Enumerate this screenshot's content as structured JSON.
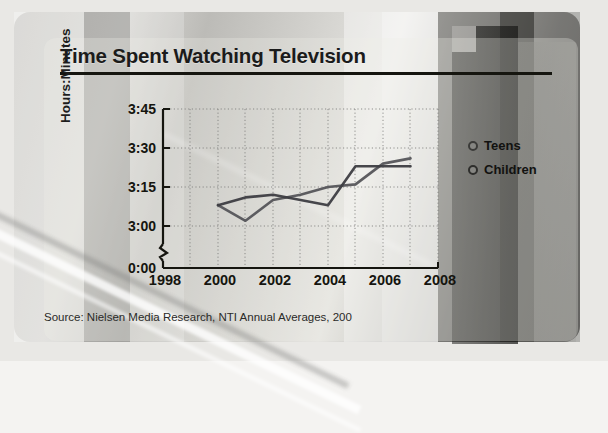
{
  "chart_data": {
    "type": "line",
    "title": "Time Spent Watching Television",
    "xlabel": "",
    "ylabel": "Hours:Minutes",
    "source": "Source: Nielsen Media Research, NTI Annual Averages, 200",
    "grid": true,
    "legend_position": "right",
    "axis_break": true,
    "x": [
      2000,
      2001,
      2002,
      2003,
      2004,
      2005,
      2006,
      2007
    ],
    "xlim": [
      1998,
      2008
    ],
    "xticks": [
      "1998",
      "2000",
      "2002",
      "2004",
      "2006",
      "2008"
    ],
    "xtick_values": [
      1998,
      2000,
      2002,
      2004,
      2006,
      2008
    ],
    "ylim_minutes": [
      180,
      225
    ],
    "yticks": [
      "0:00",
      "3:00",
      "3:15",
      "3:30",
      "3:45"
    ],
    "ytick_minutes": [
      0,
      180,
      195,
      210,
      225
    ],
    "series": [
      {
        "name": "Teens",
        "color": "#55555a",
        "values": [
          "3:08",
          "3:02",
          "3:10",
          "3:12",
          "3:15",
          "3:16",
          "3:24",
          "3:26"
        ],
        "values_minutes": [
          188,
          182,
          190,
          192,
          195,
          196,
          204,
          206
        ]
      },
      {
        "name": "Children",
        "color": "#3d3d42",
        "values": [
          "3:08",
          "3:11",
          "3:12",
          "3:10",
          "3:08",
          "3:23",
          "3:23",
          "3:23"
        ],
        "values_minutes": [
          188,
          191,
          192,
          190,
          188,
          203,
          203,
          203
        ]
      }
    ]
  },
  "chart": {
    "title": "Time Spent Watching Television",
    "ylabel": "Hours:Minutes",
    "source": "Source: Nielsen Media Research, NTI Annual Averages, 200",
    "ytick_labels": [
      "3:45",
      "3:30",
      "3:15",
      "3:00",
      "0:00"
    ],
    "xtick_labels": [
      "1998",
      "2000",
      "2002",
      "2004",
      "2006",
      "2008"
    ],
    "legend": [
      {
        "label": "Teens",
        "marker": "circle-outline-icon"
      },
      {
        "label": "Children",
        "marker": "circle-outline-icon"
      }
    ]
  }
}
